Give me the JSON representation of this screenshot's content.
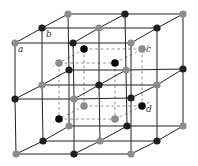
{
  "diagram": {
    "type": "crystal-lattice",
    "colors": {
      "grid_line": "#222222",
      "dashed_line": "#8a8a8a",
      "dark_atom": "#1e1e1e",
      "gray_atom": "#8c8c8c",
      "inner_black_atom": "#050505"
    },
    "lattice": {
      "levels": [
        {
          "name": "top",
          "rows": [
            {
              "name": "back",
              "nodes": [
                {
                  "x": 68,
                  "y": 14,
                  "c": "gray"
                },
                {
                  "x": 125,
                  "y": 14,
                  "c": "dark"
                },
                {
                  "x": 183,
                  "y": 14,
                  "c": "gray"
                }
              ]
            },
            {
              "name": "mid",
              "nodes": [
                {
                  "x": 42,
                  "y": 28,
                  "c": "dark"
                },
                {
                  "x": 99,
                  "y": 28,
                  "c": "gray"
                },
                {
                  "x": 157,
                  "y": 28,
                  "c": "dark"
                }
              ]
            },
            {
              "name": "front",
              "nodes": [
                {
                  "x": 15,
                  "y": 43,
                  "c": "gray"
                },
                {
                  "x": 73,
                  "y": 43,
                  "c": "dark"
                },
                {
                  "x": 131,
                  "y": 43,
                  "c": "gray"
                }
              ]
            }
          ]
        },
        {
          "name": "middle",
          "rows": [
            {
              "name": "back",
              "nodes": [
                {
                  "x": 69,
                  "y": 70,
                  "c": "dark"
                },
                {
                  "x": 126,
                  "y": 70,
                  "c": "gray"
                },
                {
                  "x": 183,
                  "y": 69,
                  "c": "dark"
                }
              ]
            },
            {
              "name": "mid",
              "nodes": [
                {
                  "x": 42,
                  "y": 85,
                  "c": "gray"
                },
                {
                  "x": 99,
                  "y": 85,
                  "c": "dark"
                },
                {
                  "x": 157,
                  "y": 85,
                  "c": "gray"
                }
              ]
            },
            {
              "name": "front",
              "nodes": [
                {
                  "x": 15,
                  "y": 99,
                  "c": "dark"
                },
                {
                  "x": 74,
                  "y": 99,
                  "c": "gray"
                },
                {
                  "x": 131,
                  "y": 98,
                  "c": "dark"
                }
              ]
            }
          ]
        },
        {
          "name": "bottom",
          "rows": [
            {
              "name": "back",
              "nodes": [
                {
                  "x": 69,
                  "y": 126,
                  "c": "gray"
                },
                {
                  "x": 127,
                  "y": 126,
                  "c": "dark"
                },
                {
                  "x": 183,
                  "y": 126,
                  "c": "gray"
                }
              ]
            },
            {
              "name": "mid",
              "nodes": [
                {
                  "x": 43,
                  "y": 141,
                  "c": "dark"
                },
                {
                  "x": 100,
                  "y": 141,
                  "c": "gray"
                },
                {
                  "x": 157,
                  "y": 141,
                  "c": "dark"
                }
              ]
            },
            {
              "name": "front",
              "nodes": [
                {
                  "x": 16,
                  "y": 154,
                  "c": "gray"
                },
                {
                  "x": 74,
                  "y": 154,
                  "c": "dark"
                },
                {
                  "x": 131,
                  "y": 154,
                  "c": "gray"
                }
              ]
            }
          ]
        }
      ]
    },
    "inner_cube": {
      "nodes": [
        {
          "id": "top-back-left",
          "x": 84,
          "y": 49,
          "c": "black"
        },
        {
          "id": "top-back-right",
          "x": 142,
          "y": 49,
          "c": "gray"
        },
        {
          "id": "top-front-left",
          "x": 59,
          "y": 63,
          "c": "gray"
        },
        {
          "id": "top-front-right",
          "x": 115,
          "y": 63,
          "c": "black"
        },
        {
          "id": "bottom-back-left",
          "x": 84,
          "y": 106,
          "c": "gray"
        },
        {
          "id": "bottom-back-right",
          "x": 142,
          "y": 106,
          "c": "black"
        },
        {
          "id": "bottom-front-left",
          "x": 59,
          "y": 119,
          "c": "black"
        },
        {
          "id": "bottom-front-right",
          "x": 115,
          "y": 119,
          "c": "gray"
        }
      ]
    },
    "labels": [
      {
        "text": "a",
        "x": 18,
        "y": 52
      },
      {
        "text": "b",
        "x": 46,
        "y": 37
      },
      {
        "text": "c",
        "x": 146,
        "y": 52
      },
      {
        "text": "d",
        "x": 146,
        "y": 112
      }
    ]
  }
}
